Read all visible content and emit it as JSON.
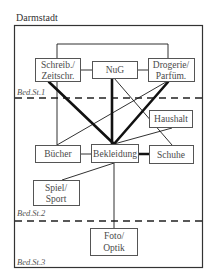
{
  "title": "Darmstadt",
  "levels": [
    {
      "id": "l1",
      "label": "Bed.St.1"
    },
    {
      "id": "l2",
      "label": "Bed.St.2"
    },
    {
      "id": "l3",
      "label": "Bed.St.3"
    }
  ],
  "nodes": {
    "schreib": {
      "line1": "Schreib./",
      "line2": "Zeitschr."
    },
    "nug": {
      "label": "NuG"
    },
    "drogerie": {
      "line1": "Drogerie/",
      "line2": "Parfüm."
    },
    "haushalt": {
      "label": "Haushalt"
    },
    "buecher": {
      "label": "Bücher"
    },
    "bekleidung": {
      "label": "Bekleidung"
    },
    "schuhe": {
      "label": "Schuhe"
    },
    "spiel": {
      "line1": "Spiel/",
      "line2": "Sport"
    },
    "foto": {
      "line1": "Foto/",
      "line2": "Optik"
    }
  },
  "edges": [
    {
      "from": "Schreib./Zeitschr.",
      "to": "NuG",
      "weight": "thin"
    },
    {
      "from": "NuG",
      "to": "Drogerie/Parfüm.",
      "weight": "thin"
    },
    {
      "from": "Schreib./Zeitschr.",
      "to": "Drogerie/Parfüm.",
      "weight": "thin"
    },
    {
      "from": "Schreib./Zeitschr.",
      "to": "Bekleidung",
      "weight": "thick"
    },
    {
      "from": "NuG",
      "to": "Bekleidung",
      "weight": "thick"
    },
    {
      "from": "Drogerie/Parfüm.",
      "to": "Bekleidung",
      "weight": "thick"
    },
    {
      "from": "Schreib./Zeitschr.",
      "to": "Bücher",
      "weight": "thin"
    },
    {
      "from": "Drogerie/Parfüm.",
      "to": "Bücher",
      "weight": "thin"
    },
    {
      "from": "NuG",
      "to": "Schuhe",
      "weight": "thin"
    },
    {
      "from": "Haushalt",
      "to": "Bekleidung",
      "weight": "thin"
    },
    {
      "from": "Bücher",
      "to": "Bekleidung",
      "weight": "thin"
    },
    {
      "from": "Bekleidung",
      "to": "Schuhe",
      "weight": "thick"
    },
    {
      "from": "Bekleidung",
      "to": "Spiel/Sport",
      "weight": "thin"
    },
    {
      "from": "Bekleidung",
      "to": "Foto/Optik",
      "weight": "thin"
    }
  ],
  "colors": {
    "line": "#1a1a1a",
    "box": "#555555",
    "text": "#4a4a4a"
  }
}
